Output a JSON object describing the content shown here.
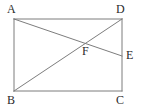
{
  "figure": {
    "type": "geometry-diagram",
    "background_color": "#ffffff",
    "stroke_color": "#7d7d7d",
    "label_color": "#2b2b2b",
    "stroke_width": 1,
    "points": {
      "A": {
        "label": "A",
        "x": 14,
        "y": 19
      },
      "D": {
        "label": "D",
        "x": 122,
        "y": 19
      },
      "B": {
        "label": "B",
        "x": 14,
        "y": 91
      },
      "C": {
        "label": "C",
        "x": 122,
        "y": 91
      },
      "E": {
        "label": "E",
        "x": 122,
        "y": 56
      },
      "F": {
        "label": "F",
        "x": 85,
        "y": 44
      }
    },
    "segments": [
      {
        "name": "side-AD",
        "from": "A",
        "to": "D",
        "x1": 14,
        "y1": 19,
        "x2": 122,
        "y2": 19
      },
      {
        "name": "side-DC",
        "from": "D",
        "to": "C",
        "x1": 122,
        "y1": 19,
        "x2": 122,
        "y2": 91
      },
      {
        "name": "side-BC",
        "from": "B",
        "to": "C",
        "x1": 14,
        "y1": 91,
        "x2": 122,
        "y2": 91
      },
      {
        "name": "side-AB",
        "from": "A",
        "to": "B",
        "x1": 14,
        "y1": 19,
        "x2": 14,
        "y2": 91
      },
      {
        "name": "diagonal-BD",
        "from": "B",
        "to": "D",
        "x1": 14,
        "y1": 91,
        "x2": 122,
        "y2": 19
      },
      {
        "name": "segment-AE",
        "from": "A",
        "to": "E",
        "x1": 14,
        "y1": 19,
        "x2": 122,
        "y2": 56
      }
    ]
  }
}
